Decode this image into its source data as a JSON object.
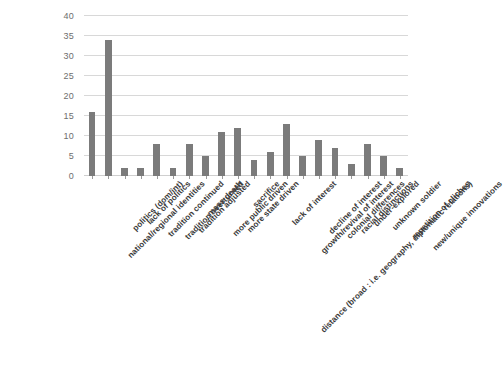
{
  "chart_data": {
    "type": "bar",
    "title": "",
    "subtitle": "",
    "xlabel": "",
    "ylabel": "",
    "ylim": [
      0,
      40
    ],
    "ytick_step": 5,
    "yticks": [
      0,
      5,
      10,
      15,
      20,
      25,
      30,
      35,
      40
    ],
    "grid": true,
    "legend": false,
    "legend_position": "none",
    "bar_color": "#7b7b7b",
    "gridline_color": "#d8d8d8",
    "axis_label_color": "#6e6e6e",
    "categories": [
      "national/regional identities",
      "politics (dom/int)",
      "lack of politics",
      "tradition continued",
      "tradition overturned",
      "tradition adjusted",
      "mass death",
      "more public driven",
      "more state driven",
      "sacrifice",
      "distance (broad : i.e. geography, diplomatic relations)",
      "lack of interest",
      "growth/revival of interest",
      "decline of interest",
      "colonial differences",
      "racial distinctions",
      "under-explored",
      "unknown soldier",
      "repetition of cliches",
      "new/unique innovations"
    ],
    "values": [
      16,
      34,
      2,
      2,
      8,
      2,
      8,
      5,
      11,
      12,
      4,
      6,
      13,
      5,
      9,
      7,
      3,
      8,
      5,
      2
    ]
  }
}
